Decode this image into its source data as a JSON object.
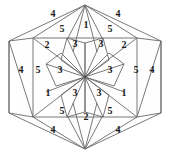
{
  "figure": {
    "shape": "hexagon",
    "symmetry": "6-fold rotational",
    "stroke_color": "#6a6a6a",
    "fill_color": "#fefefe",
    "background_color": "#ffffff",
    "label_color": "#1a1a1a"
  },
  "chart_data": {
    "type": "diagram",
    "xlabel": "",
    "ylabel": "",
    "grid": false,
    "legend": false,
    "categories": [
      "1",
      "2",
      "3",
      "4",
      "5"
    ],
    "values": [
      4,
      4,
      6,
      6,
      6
    ],
    "labels": [
      {
        "id": "top-left-4",
        "text": "4",
        "x": 53,
        "y": 14,
        "ring": "outer",
        "sector": "top-left"
      },
      {
        "id": "top-right-4",
        "text": "4",
        "x": 118,
        "y": 14,
        "ring": "outer",
        "sector": "top-right"
      },
      {
        "id": "top-left-5",
        "text": "5",
        "x": 62,
        "y": 29,
        "ring": "middle",
        "sector": "top-left"
      },
      {
        "id": "top-center-1",
        "text": "1",
        "x": 86,
        "y": 25,
        "ring": "middle",
        "sector": "top"
      },
      {
        "id": "top-right-5",
        "text": "5",
        "x": 110,
        "y": 29,
        "ring": "middle",
        "sector": "top-right"
      },
      {
        "id": "upper-left-2",
        "text": "2",
        "x": 47,
        "y": 45,
        "ring": "inner",
        "sector": "upper-left"
      },
      {
        "id": "upper-left-3",
        "text": "3",
        "x": 75,
        "y": 44,
        "ring": "core",
        "sector": "upper-left"
      },
      {
        "id": "upper-right-3",
        "text": "3",
        "x": 101,
        "y": 44,
        "ring": "core",
        "sector": "upper-right"
      },
      {
        "id": "upper-right-2",
        "text": "2",
        "x": 124,
        "y": 45,
        "ring": "inner",
        "sector": "upper-right"
      },
      {
        "id": "left-outer-4",
        "text": "4",
        "x": 21,
        "y": 70,
        "ring": "outer",
        "sector": "left"
      },
      {
        "id": "left-5",
        "text": "5",
        "x": 38,
        "y": 70,
        "ring": "middle",
        "sector": "left"
      },
      {
        "id": "left-core-3",
        "text": "3",
        "x": 60,
        "y": 70,
        "ring": "core",
        "sector": "left"
      },
      {
        "id": "right-core-3",
        "text": "3",
        "x": 110,
        "y": 70,
        "ring": "core",
        "sector": "right"
      },
      {
        "id": "right-5",
        "text": "5",
        "x": 136,
        "y": 70,
        "ring": "middle",
        "sector": "right"
      },
      {
        "id": "right-outer-4",
        "text": "4",
        "x": 152,
        "y": 70,
        "ring": "outer",
        "sector": "right"
      },
      {
        "id": "lower-left-1",
        "text": "1",
        "x": 48,
        "y": 93,
        "ring": "inner",
        "sector": "lower-left"
      },
      {
        "id": "lower-left-3",
        "text": "3",
        "x": 75,
        "y": 93,
        "ring": "core",
        "sector": "lower-left"
      },
      {
        "id": "lower-right-3",
        "text": "3",
        "x": 99,
        "y": 93,
        "ring": "core",
        "sector": "lower-right"
      },
      {
        "id": "lower-right-1",
        "text": "1",
        "x": 124,
        "y": 93,
        "ring": "inner",
        "sector": "lower-right"
      },
      {
        "id": "bottom-left-5",
        "text": "5",
        "x": 62,
        "y": 111,
        "ring": "middle",
        "sector": "bottom-left"
      },
      {
        "id": "bottom-center-2",
        "text": "2",
        "x": 86,
        "y": 117,
        "ring": "middle",
        "sector": "bottom"
      },
      {
        "id": "bottom-right-5",
        "text": "5",
        "x": 110,
        "y": 111,
        "ring": "middle",
        "sector": "bottom-right"
      },
      {
        "id": "bottom-left-4",
        "text": "4",
        "x": 53,
        "y": 130,
        "ring": "outer",
        "sector": "bottom-left"
      },
      {
        "id": "bottom-right-4",
        "text": "4",
        "x": 118,
        "y": 130,
        "ring": "outer",
        "sector": "bottom-right"
      }
    ]
  }
}
